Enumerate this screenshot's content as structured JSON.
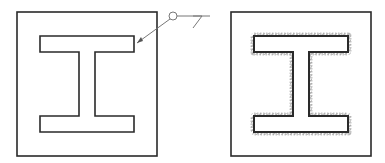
{
  "diagram": {
    "type": "weld-symbol-illustration",
    "colors": {
      "line": "#2a2a2a",
      "leader": "#777777",
      "weld_hatch": "#8a8a8a",
      "background": "#ffffff"
    },
    "left_panel": {
      "plate": {
        "x": 17,
        "y": 12,
        "w": 140,
        "h": 144
      },
      "ibeam_outline": "40,36 134,36 134,52 95,52 95,116 134,116 134,132 40,132 40,116 79,116 79,52 40,52"
    },
    "weld_symbol": {
      "leader_start": [
        137,
        43
      ],
      "leader_end": [
        170,
        19
      ],
      "all_around_circle": {
        "cx": 173,
        "cy": 16,
        "r": 4
      },
      "reference_line": [
        177,
        16,
        210,
        16
      ],
      "fillet_triangle": "193,16 202,16 193,28"
    },
    "right_panel": {
      "plate": {
        "x": 231,
        "y": 12,
        "w": 140,
        "h": 144
      },
      "ibeam_outline": "254,36 348,36 348,52 309,52 309,116 348,116 348,132 254,132 254,116 293,116 293,52 254,52",
      "weld_bead": "weld-all-around"
    }
  }
}
